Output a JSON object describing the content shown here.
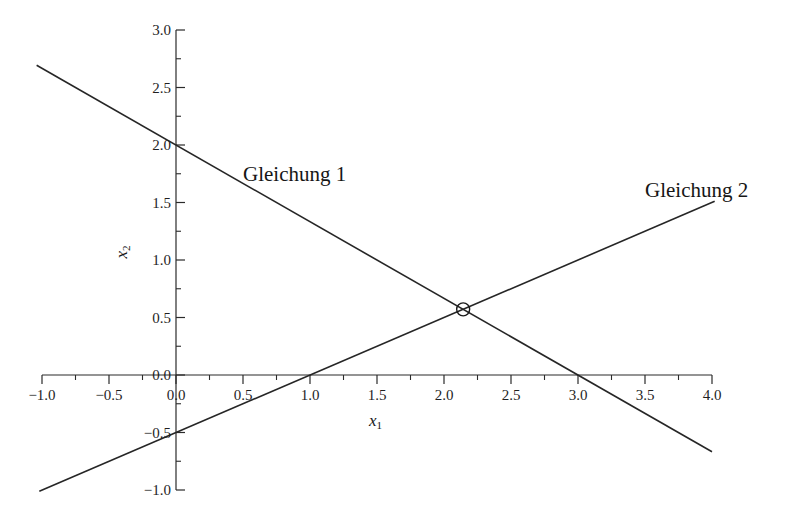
{
  "chart_data": {
    "type": "line",
    "title": "",
    "subtitle": "",
    "xlabel": "x1",
    "ylabel": "x2",
    "xlim": [
      -1.0,
      4.0
    ],
    "ylim": [
      -1.0,
      3.0
    ],
    "grid": false,
    "legend_position": "inline-annotation",
    "x_ticks": [
      {
        "value": -1.0,
        "label": "-1.0"
      },
      {
        "value": -0.5,
        "label": "-0.5"
      },
      {
        "value": 0.0,
        "label": "0.0"
      },
      {
        "value": 0.5,
        "label": "0.5"
      },
      {
        "value": 1.0,
        "label": "1.0"
      },
      {
        "value": 1.5,
        "label": "1.5"
      },
      {
        "value": 2.0,
        "label": "2.0"
      },
      {
        "value": 2.5,
        "label": "2.5"
      },
      {
        "value": 3.0,
        "label": "3.0"
      },
      {
        "value": 3.5,
        "label": "3.5"
      },
      {
        "value": 4.0,
        "label": "4.0"
      }
    ],
    "x_minor_ticks": [
      -0.75,
      -0.25,
      0.25,
      0.75,
      1.25,
      1.75,
      2.25,
      2.75,
      3.25,
      3.75
    ],
    "y_ticks": [
      {
        "value": 3.0,
        "label": "3.0"
      },
      {
        "value": 2.5,
        "label": "2.5"
      },
      {
        "value": 2.0,
        "label": "2.0"
      },
      {
        "value": 1.5,
        "label": "1.5"
      },
      {
        "value": 1.0,
        "label": "1.0"
      },
      {
        "value": 0.5,
        "label": "0.5"
      },
      {
        "value": 0.0,
        "label": "0.0"
      },
      {
        "value": -0.5,
        "label": "-0.5"
      },
      {
        "value": -1.0,
        "label": "-1.0"
      }
    ],
    "y_minor_ticks": [
      2.75,
      2.25,
      1.75,
      1.25,
      0.75,
      0.25,
      -0.25,
      -0.75
    ],
    "series": [
      {
        "name": "Gleichung 1",
        "label": "Gleichung 1",
        "slope": -0.6667,
        "intercept": 2.0,
        "x_intercept": 3.0,
        "points": [
          [
            -1.04,
            2.693
          ],
          [
            4.0,
            -0.667
          ]
        ],
        "color": "#262626"
      },
      {
        "name": "Gleichung 2",
        "label": "Gleichung 2",
        "slope": 0.5,
        "intercept": -0.5,
        "x_intercept": 1.0,
        "points": [
          [
            -1.02,
            -1.01
          ],
          [
            4.02,
            1.51
          ]
        ],
        "color": "#262626"
      }
    ],
    "markers": [
      {
        "name": "intersection",
        "x": 2.143,
        "y": 0.571,
        "shape": "circle",
        "filled": false
      }
    ],
    "annotations": [
      {
        "name": "series-label-1",
        "text": "Gleichung 1",
        "x": 0.5,
        "y": 1.79
      },
      {
        "name": "series-label-2",
        "text": "Gleichung 2",
        "x": 3.5,
        "y": 1.66
      }
    ]
  },
  "axis_titles": {
    "x": {
      "base": "x",
      "sub": "1"
    },
    "y": {
      "base": "x",
      "sub": "2"
    }
  },
  "labels": {
    "eq1": "Gleichung 1",
    "eq2": "Gleichung 2"
  },
  "colors": {
    "axis": "#2b2b2b",
    "line": "#262626",
    "text": "#161616",
    "background": "#ffffff"
  }
}
